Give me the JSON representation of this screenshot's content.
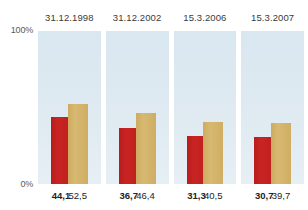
{
  "chart_data": {
    "type": "bar",
    "title": "",
    "subtitle": "",
    "xlabel": "",
    "ylabel": "",
    "ylim": [
      0,
      100
    ],
    "yticks": [
      "0%",
      "100%"
    ],
    "grid": false,
    "legend": "none",
    "categories": [
      "31.12.1998",
      "31.12.2002",
      "15.3.2006",
      "15.3.2007"
    ],
    "series": [
      {
        "name": "red-series",
        "color": "#c42020",
        "values": [
          44.1,
          36.7,
          31.3,
          30.7
        ],
        "labels": [
          "44,1",
          "36,7",
          "31,3",
          "30,7"
        ]
      },
      {
        "name": "beige-series",
        "color": "#d4b36a",
        "values": [
          52.5,
          46.4,
          40.5,
          39.7
        ],
        "labels": [
          "52,5",
          "46,4",
          "40,5",
          "39,7"
        ]
      }
    ]
  },
  "axis": {
    "y_top_label": "100%",
    "y_bottom_label": "0%"
  },
  "panel_background": "#dde9f1",
  "groups": [
    {
      "header": "31.12.1998",
      "red_label": "44,1",
      "beige_label": "52,5",
      "red_value": 44.1,
      "beige_value": 52.5
    },
    {
      "header": "31.12.2002",
      "red_label": "36,7",
      "beige_label": "46,4",
      "red_value": 36.7,
      "beige_value": 46.4
    },
    {
      "header": "15.3.2006",
      "red_label": "31,3",
      "beige_label": "40,5",
      "red_value": 31.3,
      "beige_value": 40.5
    },
    {
      "header": "15.3.2007",
      "red_label": "30,7",
      "beige_label": "39,7",
      "red_value": 30.7,
      "beige_value": 39.7
    }
  ]
}
